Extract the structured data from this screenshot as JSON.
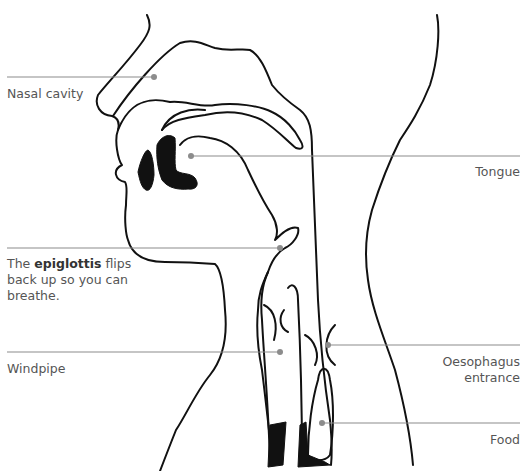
{
  "diagram": {
    "type": "anatomical cross-section of head and throat during swallowing",
    "labels": {
      "nasal_cavity": "Nasal cavity",
      "tongue": "Tongue",
      "epiglottis_prefix": "The ",
      "epiglottis_bold": "epiglottis",
      "epiglottis_suffix": " flips",
      "epiglottis_line2": "back up so you can",
      "epiglottis_line3": "breathe.",
      "windpipe": "Windpipe",
      "oesophagus_line1": "Oesophagus",
      "oesophagus_line2": "entrance",
      "food": "Food"
    },
    "colors": {
      "outline": "#111111",
      "leader_line": "#8c8c8c",
      "label_text": "#555555",
      "background": "#ffffff"
    }
  }
}
